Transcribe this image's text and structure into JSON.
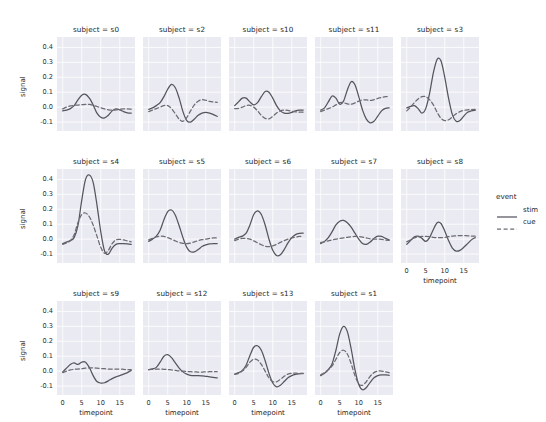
{
  "chart_data": {
    "type": "line",
    "title": "",
    "xlabel": "timepoint",
    "ylabel": "signal",
    "xlim": [
      -1.5,
      19
    ],
    "ylim": [
      -0.16,
      0.47
    ],
    "xticks": [
      0,
      5,
      10,
      15
    ],
    "yticks": [
      "0.4",
      "0.3",
      "0.2",
      "0.1",
      "0.0",
      "-0.1"
    ],
    "ytick_values": [
      0.4,
      0.3,
      0.2,
      0.1,
      0.0,
      -0.1
    ],
    "grid": true,
    "facet_var": "subject",
    "facet_title_template": "subject = ",
    "legend": {
      "title": "event",
      "position": "right",
      "entries": [
        {
          "label": "stim",
          "style": "solid",
          "color": "#55555f"
        },
        {
          "label": "cue",
          "style": "dashed",
          "color": "#6b6b74"
        }
      ]
    },
    "x": [
      0,
      1,
      2,
      3,
      4,
      5,
      6,
      7,
      8,
      9,
      10,
      11,
      12,
      13,
      14,
      15,
      16,
      17,
      18
    ],
    "panels": [
      {
        "facet": "s0",
        "title": "subject = s0",
        "row": 0,
        "col": 0,
        "series": [
          {
            "name": "stim",
            "values": [
              -0.025,
              -0.02,
              -0.01,
              0.01,
              0.048,
              0.08,
              0.085,
              0.06,
              0.015,
              -0.04,
              -0.068,
              -0.072,
              -0.055,
              -0.025,
              -0.012,
              -0.018,
              -0.03,
              -0.038,
              -0.04
            ]
          },
          {
            "name": "cue",
            "values": [
              -0.012,
              0.0,
              0.008,
              0.012,
              0.014,
              0.016,
              0.018,
              0.018,
              0.012,
              0.004,
              -0.004,
              -0.012,
              -0.018,
              -0.02,
              -0.018,
              -0.014,
              -0.012,
              -0.012,
              -0.014
            ]
          }
        ]
      },
      {
        "facet": "s2",
        "title": "subject = s2",
        "row": 0,
        "col": 1,
        "series": [
          {
            "name": "stim",
            "values": [
              -0.015,
              -0.005,
              0.01,
              0.03,
              0.07,
              0.12,
              0.152,
              0.13,
              0.06,
              -0.03,
              -0.09,
              -0.1,
              -0.08,
              -0.055,
              -0.04,
              -0.035,
              -0.04,
              -0.05,
              -0.062
            ]
          },
          {
            "name": "cue",
            "values": [
              -0.03,
              -0.02,
              -0.01,
              0.0,
              0.01,
              0.01,
              -0.01,
              -0.045,
              -0.08,
              -0.095,
              -0.07,
              -0.025,
              0.015,
              0.04,
              0.05,
              0.046,
              0.038,
              0.034,
              0.032
            ]
          }
        ]
      },
      {
        "facet": "s10",
        "title": "subject = s10",
        "row": 0,
        "col": 2,
        "series": [
          {
            "name": "stim",
            "values": [
              0.01,
              0.035,
              0.06,
              0.06,
              0.035,
              0.015,
              0.03,
              0.07,
              0.105,
              0.1,
              0.06,
              0.01,
              -0.025,
              -0.04,
              -0.042,
              -0.035,
              -0.025,
              -0.02,
              -0.02
            ]
          },
          {
            "name": "cue",
            "values": [
              -0.01,
              -0.008,
              0.0,
              0.01,
              0.012,
              0.0,
              -0.025,
              -0.055,
              -0.075,
              -0.078,
              -0.062,
              -0.04,
              -0.025,
              -0.02,
              -0.022,
              -0.028,
              -0.032,
              -0.034,
              -0.034
            ]
          }
        ]
      },
      {
        "facet": "s11",
        "title": "subject = s11",
        "row": 0,
        "col": 3,
        "series": [
          {
            "name": "stim",
            "values": [
              -0.02,
              -0.005,
              0.035,
              0.075,
              0.06,
              0.02,
              0.04,
              0.115,
              0.17,
              0.15,
              0.07,
              -0.02,
              -0.08,
              -0.105,
              -0.095,
              -0.06,
              -0.025,
              -0.008,
              -0.005
            ]
          },
          {
            "name": "cue",
            "values": [
              -0.03,
              -0.02,
              -0.01,
              0.0,
              0.015,
              0.03,
              0.03,
              0.022,
              0.02,
              0.028,
              0.04,
              0.048,
              0.048,
              0.045,
              0.05,
              0.058,
              0.065,
              0.07,
              0.072
            ]
          }
        ]
      },
      {
        "facet": "s3",
        "title": "subject = s3",
        "row": 0,
        "col": 4,
        "series": [
          {
            "name": "stim",
            "values": [
              -0.005,
              0.005,
              0.01,
              -0.01,
              -0.04,
              -0.01,
              0.09,
              0.23,
              0.32,
              0.31,
              0.2,
              0.06,
              -0.05,
              -0.095,
              -0.09,
              -0.06,
              -0.035,
              -0.025,
              -0.022
            ]
          },
          {
            "name": "cue",
            "values": [
              -0.025,
              0.0,
              0.03,
              0.055,
              0.07,
              0.07,
              0.05,
              0.015,
              -0.035,
              -0.075,
              -0.09,
              -0.085,
              -0.065,
              -0.045,
              -0.03,
              -0.022,
              -0.018,
              -0.016,
              -0.015
            ]
          }
        ]
      },
      {
        "facet": "s4",
        "title": "subject = s4",
        "row": 1,
        "col": 0,
        "series": [
          {
            "name": "stim",
            "values": [
              -0.03,
              -0.02,
              -0.01,
              0.01,
              0.09,
              0.26,
              0.4,
              0.43,
              0.38,
              0.23,
              0.05,
              -0.08,
              -0.1,
              -0.06,
              -0.035,
              -0.03,
              -0.03,
              -0.032,
              -0.035
            ]
          },
          {
            "name": "cue",
            "values": [
              -0.035,
              -0.025,
              -0.01,
              0.03,
              0.11,
              0.165,
              0.175,
              0.15,
              0.095,
              0.02,
              -0.055,
              -0.095,
              -0.075,
              -0.03,
              -0.005,
              -0.002,
              -0.005,
              -0.012,
              -0.018
            ]
          }
        ]
      },
      {
        "facet": "s5",
        "title": "subject = s5",
        "row": 1,
        "col": 1,
        "series": [
          {
            "name": "stim",
            "values": [
              -0.015,
              0.0,
              0.02,
              0.06,
              0.13,
              0.185,
              0.195,
              0.16,
              0.09,
              0.01,
              -0.055,
              -0.085,
              -0.085,
              -0.07,
              -0.05,
              -0.038,
              -0.032,
              -0.03,
              -0.03
            ]
          },
          {
            "name": "cue",
            "values": [
              -0.005,
              0.005,
              0.015,
              0.02,
              0.018,
              0.01,
              0.0,
              -0.012,
              -0.022,
              -0.028,
              -0.03,
              -0.026,
              -0.018,
              -0.01,
              -0.004,
              0.0,
              0.005,
              0.008,
              0.008
            ]
          }
        ]
      },
      {
        "facet": "s6",
        "title": "subject = s6",
        "row": 1,
        "col": 2,
        "series": [
          {
            "name": "stim",
            "values": [
              0.0,
              0.012,
              0.02,
              0.04,
              0.095,
              0.165,
              0.19,
              0.165,
              0.095,
              0.0,
              -0.075,
              -0.11,
              -0.105,
              -0.07,
              -0.025,
              0.01,
              0.03,
              0.038,
              0.04
            ]
          },
          {
            "name": "cue",
            "values": [
              -0.01,
              0.0,
              0.005,
              0.005,
              0.0,
              -0.012,
              -0.025,
              -0.038,
              -0.048,
              -0.05,
              -0.045,
              -0.035,
              -0.022,
              -0.01,
              0.0,
              0.008,
              0.014,
              0.018,
              0.018
            ]
          }
        ]
      },
      {
        "facet": "s7",
        "title": "subject = s7",
        "row": 1,
        "col": 3,
        "series": [
          {
            "name": "stim",
            "values": [
              -0.03,
              -0.015,
              0.01,
              0.05,
              0.095,
              0.12,
              0.125,
              0.11,
              0.08,
              0.04,
              0.0,
              -0.03,
              -0.035,
              -0.02,
              0.005,
              0.02,
              0.018,
              0.005,
              -0.005
            ]
          },
          {
            "name": "cue",
            "values": [
              -0.022,
              -0.018,
              -0.012,
              -0.005,
              0.0,
              0.004,
              0.008,
              0.012,
              0.016,
              0.018,
              0.018,
              0.014,
              0.008,
              0.002,
              0.0,
              0.0,
              -0.002,
              -0.006,
              -0.008
            ]
          }
        ]
      },
      {
        "facet": "s8",
        "title": "subject = s8",
        "row": 1,
        "col": 4,
        "series": [
          {
            "name": "stim",
            "values": [
              -0.035,
              -0.01,
              0.015,
              0.02,
              0.005,
              -0.015,
              0.01,
              0.065,
              0.11,
              0.105,
              0.055,
              -0.01,
              -0.06,
              -0.08,
              -0.075,
              -0.055,
              -0.03,
              -0.005,
              0.01
            ]
          },
          {
            "name": "cue",
            "values": [
              -0.018,
              -0.005,
              0.008,
              0.015,
              0.018,
              0.018,
              0.016,
              0.012,
              0.01,
              0.01,
              0.012,
              0.016,
              0.02,
              0.022,
              0.024,
              0.024,
              0.022,
              0.02,
              0.02
            ]
          }
        ]
      },
      {
        "facet": "s9",
        "title": "subject = s9",
        "row": 2,
        "col": 0,
        "series": [
          {
            "name": "stim",
            "values": [
              -0.005,
              0.02,
              0.045,
              0.055,
              0.045,
              0.06,
              0.06,
              0.025,
              -0.03,
              -0.07,
              -0.08,
              -0.078,
              -0.065,
              -0.05,
              -0.038,
              -0.03,
              -0.02,
              -0.01,
              0.005
            ]
          },
          {
            "name": "cue",
            "values": [
              -0.01,
              0.0,
              0.008,
              0.012,
              0.014,
              0.016,
              0.02,
              0.022,
              0.022,
              0.02,
              0.018,
              0.016,
              0.014,
              0.014,
              0.014,
              0.014,
              0.012,
              0.01,
              0.01
            ]
          }
        ]
      },
      {
        "facet": "s12",
        "title": "subject = s12",
        "row": 2,
        "col": 1,
        "series": [
          {
            "name": "stim",
            "values": [
              0.01,
              0.015,
              0.025,
              0.06,
              0.1,
              0.11,
              0.09,
              0.055,
              0.02,
              -0.005,
              -0.02,
              -0.028,
              -0.03,
              -0.03,
              -0.032,
              -0.035,
              -0.038,
              -0.042,
              -0.045
            ]
          },
          {
            "name": "cue",
            "values": [
              0.01,
              0.012,
              0.014,
              0.014,
              0.012,
              0.01,
              0.008,
              0.005,
              0.002,
              0.0,
              -0.002,
              -0.004,
              -0.005,
              -0.006,
              -0.006,
              -0.005,
              -0.004,
              -0.004,
              -0.004
            ]
          }
        ]
      },
      {
        "facet": "s13",
        "title": "subject = s13",
        "row": 2,
        "col": 2,
        "series": [
          {
            "name": "stim",
            "values": [
              -0.02,
              -0.01,
              0.005,
              0.04,
              0.105,
              0.16,
              0.17,
              0.14,
              0.07,
              -0.015,
              -0.08,
              -0.105,
              -0.095,
              -0.07,
              -0.045,
              -0.03,
              -0.022,
              -0.018,
              -0.015
            ]
          },
          {
            "name": "cue",
            "values": [
              -0.022,
              -0.015,
              0.0,
              0.025,
              0.06,
              0.08,
              0.075,
              0.045,
              0.0,
              -0.045,
              -0.07,
              -0.072,
              -0.055,
              -0.035,
              -0.02,
              -0.015,
              -0.014,
              -0.015,
              -0.016
            ]
          }
        ]
      },
      {
        "facet": "s1",
        "title": "subject = s1",
        "row": 2,
        "col": 3,
        "series": [
          {
            "name": "stim",
            "values": [
              -0.03,
              -0.015,
              0.01,
              0.05,
              0.14,
              0.25,
              0.3,
              0.265,
              0.15,
              0.01,
              -0.09,
              -0.125,
              -0.11,
              -0.075,
              -0.045,
              -0.03,
              -0.025,
              -0.025,
              -0.028
            ]
          },
          {
            "name": "cue",
            "values": [
              -0.025,
              -0.01,
              0.01,
              0.035,
              0.08,
              0.125,
              0.14,
              0.115,
              0.05,
              -0.03,
              -0.085,
              -0.095,
              -0.07,
              -0.035,
              -0.01,
              0.0,
              0.0,
              -0.005,
              -0.01
            ]
          }
        ]
      }
    ]
  },
  "style": {
    "panel_bg": "#eaeaf2",
    "grid_color": "#ffffff",
    "stim_color": "#55555f",
    "cue_color": "#6b6b74",
    "text_color": "#262626"
  }
}
